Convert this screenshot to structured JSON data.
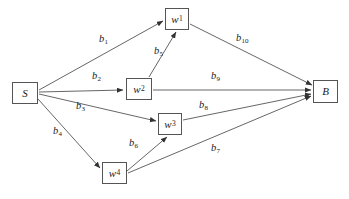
{
  "diagram": {
    "stroke_color": "#555555",
    "text_color": "#1a1a1a",
    "background": "#ffffff",
    "nodes": [
      {
        "id": "S",
        "label": "S",
        "sub": "",
        "x": 12,
        "y": 82,
        "w": 26,
        "h": 22
      },
      {
        "id": "w1",
        "label": "w",
        "sub": "1",
        "x": 165,
        "y": 8,
        "w": 24,
        "h": 22
      },
      {
        "id": "w2",
        "label": "w",
        "sub": "2",
        "x": 126,
        "y": 78,
        "w": 26,
        "h": 22
      },
      {
        "id": "w3",
        "label": "w",
        "sub": "3",
        "x": 158,
        "y": 113,
        "w": 24,
        "h": 22
      },
      {
        "id": "w4",
        "label": "w",
        "sub": "4",
        "x": 102,
        "y": 162,
        "w": 25,
        "h": 22
      },
      {
        "id": "B",
        "label": "B",
        "sub": "",
        "x": 313,
        "y": 80,
        "w": 25,
        "h": 23
      }
    ],
    "edges": [
      {
        "id": "b1",
        "label": "b",
        "sub": "1",
        "from": "S",
        "to": "w1",
        "x1": 39,
        "y1": 90,
        "x2": 163,
        "y2": 21,
        "label_x": 99,
        "label_y": 34
      },
      {
        "id": "b2",
        "label": "b",
        "sub": "2",
        "from": "S",
        "to": "w2",
        "x1": 39,
        "y1": 92,
        "x2": 123,
        "y2": 90,
        "label_x": 92,
        "label_y": 71
      },
      {
        "id": "b3",
        "label": "b",
        "sub": "3",
        "from": "S",
        "to": "w3",
        "x1": 39,
        "y1": 94,
        "x2": 156,
        "y2": 121,
        "label_x": 76,
        "label_y": 101
      },
      {
        "id": "b4",
        "label": "b",
        "sub": "4",
        "from": "S",
        "to": "w4",
        "x1": 38,
        "y1": 99,
        "x2": 100,
        "y2": 168,
        "label_x": 53,
        "label_y": 126
      },
      {
        "id": "b5",
        "label": "b",
        "sub": "5",
        "from": "w2",
        "to": "w1",
        "x1": 149,
        "y1": 77,
        "x2": 176,
        "y2": 32,
        "label_x": 154,
        "label_y": 46
      },
      {
        "id": "b6",
        "label": "b",
        "sub": "6",
        "from": "w4",
        "to": "w3",
        "x1": 127,
        "y1": 171,
        "x2": 167,
        "y2": 137,
        "label_x": 129,
        "label_y": 138
      },
      {
        "id": "b7",
        "label": "b",
        "sub": "7",
        "from": "w4",
        "to": "B",
        "x1": 128,
        "y1": 173,
        "x2": 311,
        "y2": 96,
        "label_x": 211,
        "label_y": 143
      },
      {
        "id": "b8",
        "label": "b",
        "sub": "8",
        "from": "w3",
        "to": "B",
        "x1": 183,
        "y1": 120,
        "x2": 311,
        "y2": 94,
        "label_x": 199,
        "label_y": 100
      },
      {
        "id": "b9",
        "label": "b",
        "sub": "9",
        "from": "w2",
        "to": "B",
        "x1": 153,
        "y1": 90,
        "x2": 311,
        "y2": 90,
        "label_x": 211,
        "label_y": 71
      },
      {
        "id": "b10",
        "label": "b",
        "sub": "10",
        "from": "w1",
        "to": "B",
        "x1": 190,
        "y1": 24,
        "x2": 312,
        "y2": 85,
        "label_x": 236,
        "label_y": 33
      }
    ]
  }
}
